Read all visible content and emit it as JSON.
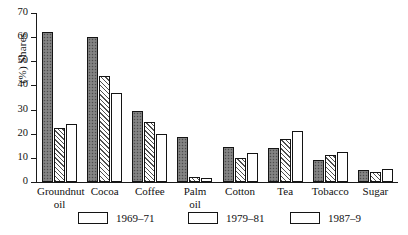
{
  "chart_data": {
    "type": "bar",
    "title": "",
    "xlabel": "",
    "ylabel": "(%) Shares",
    "ylim": [
      0,
      70
    ],
    "yticks": [
      0,
      10,
      20,
      30,
      40,
      50,
      60,
      70
    ],
    "grid": false,
    "legend_position": "bottom",
    "categories": [
      "Groundnut\noil",
      "Cocoa",
      "Coffee",
      "Palm\noil",
      "Cotton",
      "Tea",
      "Tobacco",
      "Sugar"
    ],
    "series": [
      {
        "name": "1969–71",
        "pattern": "solid-gray-stipple",
        "color": "#7b7b7b",
        "values": [
          62,
          60,
          29.5,
          18.5,
          14.5,
          14,
          9,
          5
        ]
      },
      {
        "name": "1979–81",
        "pattern": "diagonal-hatch",
        "color": "#f2f2f2",
        "values": [
          22.5,
          44,
          25,
          2,
          10,
          18,
          11,
          4
        ]
      },
      {
        "name": "1987–9",
        "pattern": "empty-white",
        "color": "#ffffff",
        "values": [
          24,
          37,
          20,
          1.5,
          12,
          21,
          12.5,
          5.5
        ]
      }
    ]
  },
  "axis": {
    "y_title": "(%) Shares",
    "tick_labels": [
      "70",
      "60",
      "50",
      "40",
      "30",
      "20",
      "10",
      "0"
    ]
  },
  "legend": {
    "items": [
      {
        "label": "1969–71"
      },
      {
        "label": "1979–81"
      },
      {
        "label": "1987–9"
      }
    ]
  }
}
